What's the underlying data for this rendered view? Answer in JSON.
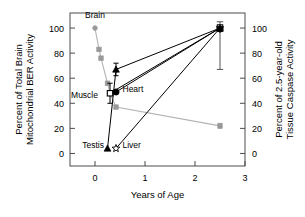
{
  "chart_data": {
    "type": "scatter",
    "title": "",
    "xlabel": "Years of Age",
    "ylabel_left": "Percent of Total Brain Mitochondrial BER Activity",
    "ylabel_left_line1": "Percent of Total Brain",
    "ylabel_left_line2": "Mitochondrial BER Activity",
    "ylabel_right": "Percent of 2.5-year-old Tissue Caspase Activity",
    "ylabel_right_line1": "Percent of 2.5-year-old",
    "ylabel_right_line2": "Tissue Caspase Activity",
    "xlim": [
      -0.5,
      3.0
    ],
    "ylim_left": [
      -10,
      112
    ],
    "ylim_right": [
      -10,
      112
    ],
    "xticks": [
      0,
      1,
      2,
      3
    ],
    "xtick_labels": [
      "0",
      "1",
      "2",
      "3"
    ],
    "yticks_left": [
      0,
      20,
      40,
      60,
      80,
      100
    ],
    "ytick_labels_left": [
      "0",
      "20",
      "40",
      "60",
      "80",
      "100"
    ],
    "yticks_right": [
      0,
      20,
      40,
      60,
      80,
      100
    ],
    "ytick_labels_right": [
      "0",
      "20",
      "40",
      "60",
      "80",
      "100"
    ],
    "grid": false,
    "legend_position": "inline-annotations",
    "annotations": [
      {
        "text": "Brain",
        "x": 0.0,
        "y": 108,
        "anchor": "middle"
      },
      {
        "text": "Muscle",
        "x": 0.06,
        "y": 44,
        "anchor": "end"
      },
      {
        "text": "Heart",
        "x": 0.55,
        "y": 49,
        "anchor": "start"
      },
      {
        "text": "Testis",
        "x": 0.18,
        "y": 4,
        "anchor": "end"
      },
      {
        "text": "Liver",
        "x": 0.55,
        "y": 4,
        "anchor": "start"
      }
    ],
    "series": [
      {
        "name": "Brain",
        "marker": "circle-gray",
        "color": "#999999",
        "line_color": "#b3b3b3",
        "x": [
          0.0,
          0.08,
          0.12,
          0.25,
          0.3,
          0.42,
          2.5
        ],
        "values": [
          100,
          83,
          76,
          56,
          48,
          37,
          22
        ],
        "errors": [
          0,
          0,
          0,
          0,
          0,
          0,
          2
        ]
      },
      {
        "name": "Muscle",
        "marker": "open-square",
        "color": "#000000",
        "line_color": "#000000",
        "x": [
          0.3,
          2.5
        ],
        "values": [
          48,
          100
        ],
        "errors": [
          8,
          0
        ]
      },
      {
        "name": "Heart",
        "marker": "filled-circle",
        "color": "#000000",
        "line_color": "#000000",
        "x": [
          0.42,
          2.5
        ],
        "values": [
          49,
          100
        ],
        "errors": [
          0,
          0
        ]
      },
      {
        "name": "Testis",
        "marker": "filled-triangle",
        "color": "#000000",
        "line_color": "#000000",
        "x": [
          0.25,
          0.42,
          2.5
        ],
        "values": [
          4,
          67,
          100
        ],
        "errors": [
          0,
          5,
          0
        ]
      },
      {
        "name": "Liver",
        "marker": "open-star",
        "color": "#000000",
        "line_color": "#000000",
        "x": [
          0.42,
          2.5
        ],
        "values": [
          4,
          100
        ],
        "errors": [
          0,
          33
        ]
      }
    ],
    "endpoint": {
      "x": 2.5,
      "y": 100,
      "error_upper": 5,
      "error_lower": 33
    }
  },
  "colors": {
    "axis": "#4c4c4c",
    "text": "#000000",
    "gray_series": "#999999",
    "gray_line": "#b3b3b3",
    "background": "#ffffff"
  }
}
